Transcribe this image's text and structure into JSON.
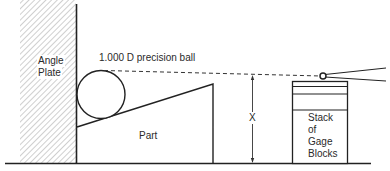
{
  "diagram": {
    "labels": {
      "angle_plate_line1": "Angle",
      "angle_plate_line2": "Plate",
      "ball": "1.000 D precision ball",
      "part": "Part",
      "dimension": "X",
      "stack_line1": "Stack",
      "stack_line2": "of",
      "stack_line3": "Gage",
      "stack_line4": "Blocks"
    },
    "colors": {
      "stroke": "#222222",
      "hatch": "#b0b0b0",
      "background": "#ffffff"
    }
  }
}
